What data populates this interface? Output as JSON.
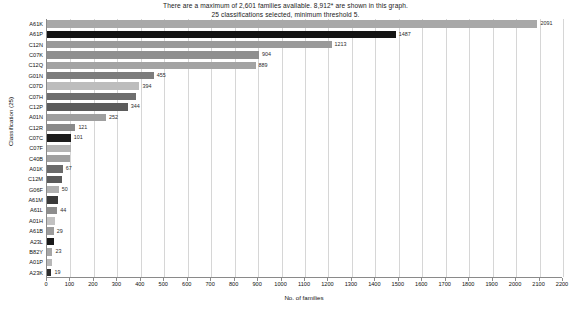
{
  "title": {
    "line1": "There are a maximum of 2,601 families available. 8,912* are shown in this graph.",
    "line2": "25 classifications selected, minimum threshold 5."
  },
  "chart_data": {
    "type": "bar",
    "orientation": "horizontal",
    "title": "There are a maximum of 2,601 families available. 8,912* are shown in this graph.",
    "subtitle": "25 classifications selected, minimum threshold 5.",
    "xlabel": "No. of families",
    "ylabel": "Classification (25)",
    "xlim": [
      0,
      2200
    ],
    "grid": true,
    "legend": false,
    "xticks": [
      0,
      100,
      200,
      300,
      400,
      500,
      600,
      700,
      800,
      900,
      1000,
      1100,
      1200,
      1300,
      1400,
      1500,
      1600,
      1700,
      1800,
      1900,
      2000,
      2100,
      2200
    ],
    "categories": [
      "A61K",
      "A61P",
      "C12N",
      "C07K",
      "C12Q",
      "G01N",
      "C07D",
      "C07H",
      "C12P",
      "A01N",
      "C12R",
      "C07C",
      "C07F",
      "C40B",
      "A01K",
      "C12M",
      "G06F",
      "A61M",
      "A61L",
      "A01H",
      "A61B",
      "A23L",
      "B82Y",
      "A01P",
      "A23K"
    ],
    "values": [
      2091,
      1487,
      1213,
      904,
      889,
      455,
      394,
      381,
      344,
      252,
      121,
      101,
      101,
      97,
      67,
      62,
      50,
      48,
      44,
      35,
      29,
      28,
      23,
      21,
      19
    ],
    "labels_shown": [
      "2091",
      "1487",
      "1213",
      "904",
      "889",
      "455",
      "394",
      "",
      "344",
      "252",
      "121",
      "101",
      "",
      "",
      "67",
      "",
      "50",
      "",
      "44",
      "",
      "29",
      "",
      "23",
      "",
      "19"
    ],
    "bar_colors": [
      "#a8a8a8",
      "#141414",
      "#9a9a9a",
      "#8f8f8f",
      "#a3a3a3",
      "#7d7d7d",
      "#bdbdbd",
      "#6e6e6e",
      "#5c5c5c",
      "#9f9f9f",
      "#8a8a8a",
      "#1c1c1c",
      "#b5b5b5",
      "#a0a0a0",
      "#6a6a6a",
      "#5a5a5a",
      "#b0b0b0",
      "#3a3a3a",
      "#8d8d8d",
      "#c2c2c2",
      "#9c9c9c",
      "#1a1a1a",
      "#a6a6a6",
      "#b8b8b8",
      "#2e2e2e"
    ]
  }
}
